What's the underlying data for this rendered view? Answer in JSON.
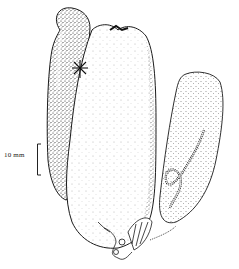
{
  "figure": {
    "type": "scientific stipple illustration",
    "specimens": [
      {
        "id": "left-specimen",
        "shading": "dense stipple",
        "feature": "narrow elongated body"
      },
      {
        "id": "center-specimen",
        "shading": "light stipple",
        "feature": "star-shaped mark near top, frilled appendage at base"
      },
      {
        "id": "right-specimen",
        "shading": "medium stipple",
        "feature": "coiled tube visible inside"
      }
    ]
  },
  "scale_bar": {
    "label": "10 mm",
    "orientation": "vertical"
  },
  "colors": {
    "ink": "#1a1a1a",
    "background": "#ffffff"
  }
}
